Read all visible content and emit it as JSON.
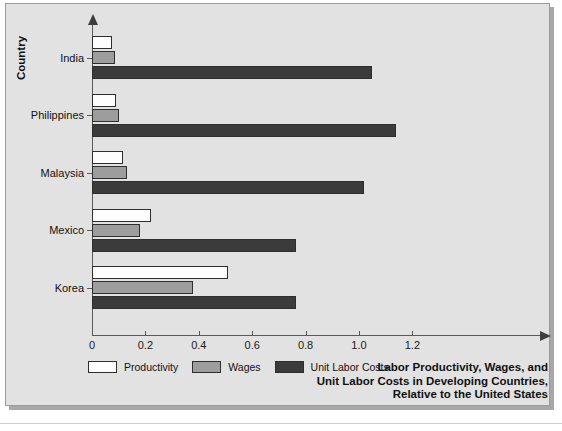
{
  "chart_data": {
    "type": "bar",
    "orientation": "horizontal",
    "title_lines": [
      "Labor Productivity, Wages, and",
      "Unit Labor Costs in Developing Countries,",
      "Relative to the United States"
    ],
    "xlabel": "",
    "ylabel": "Country",
    "categories": [
      "India",
      "Philippines",
      "Malaysia",
      "Mexico",
      "Korea"
    ],
    "series": [
      {
        "name": "Productivity",
        "color": "#fdfdfd",
        "values": [
          0.075,
          0.09,
          0.115,
          0.22,
          0.51
        ]
      },
      {
        "name": "Wages",
        "color": "#9d9d9d",
        "values": [
          0.085,
          0.1,
          0.13,
          0.18,
          0.38
        ]
      },
      {
        "name": "Unit Labor Costs",
        "color": "#3b3b3b",
        "values": [
          1.05,
          1.14,
          1.02,
          0.765,
          0.765
        ]
      }
    ],
    "xlim": [
      0,
      1.4
    ],
    "xticks": [
      0,
      0.2,
      0.4,
      0.6,
      0.8,
      1.0,
      1.2
    ],
    "xtick_labels": [
      "0",
      "0.2",
      "0.4",
      "0.6",
      "0.8",
      "1.0",
      "1.2"
    ],
    "grid": false,
    "legend_position": "bottom-left",
    "legend_entries": [
      "Productivity",
      "Wages",
      "Unit Labor Costs"
    ]
  },
  "axis": {
    "y_title": "Country"
  },
  "colors": {
    "background": "#e2e2e2",
    "axis": "#5a5a5a",
    "text": "#111111",
    "productivity": "#fdfdfd",
    "wages": "#9d9d9d",
    "unit_labor_costs": "#3b3b3b"
  }
}
